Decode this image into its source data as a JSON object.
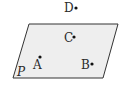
{
  "diagram": {
    "type": "geometry-plane-points",
    "plane": {
      "label": "P",
      "corners": [
        [
          29,
          24
        ],
        [
          118,
          24
        ],
        [
          103,
          78
        ],
        [
          13,
          78
        ]
      ],
      "fill": "#eeeeee",
      "stroke": "#333333"
    },
    "points": [
      {
        "label": "D",
        "dot": [
          76,
          8
        ],
        "text": [
          64,
          12
        ],
        "location": "above plane"
      },
      {
        "label": "C",
        "dot": [
          74,
          37
        ],
        "text": [
          64,
          42
        ],
        "location": "in plane"
      },
      {
        "label": "A",
        "dot": [
          40,
          57
        ],
        "text": [
          33,
          69
        ],
        "location": "in plane"
      },
      {
        "label": "B",
        "dot": [
          92,
          64
        ],
        "text": [
          81,
          69
        ],
        "location": "in plane"
      }
    ],
    "plane_label_pos": [
      17,
      76
    ]
  }
}
